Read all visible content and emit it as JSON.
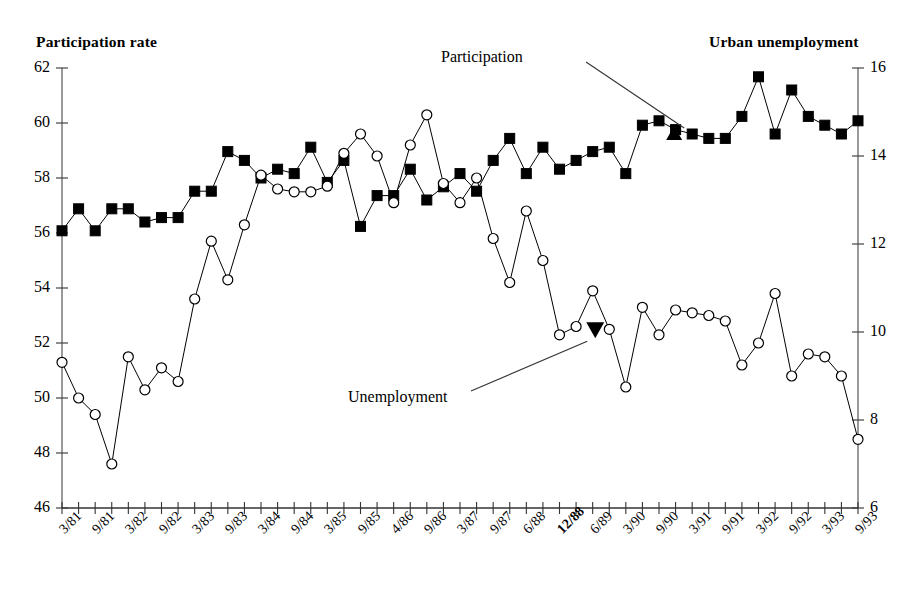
{
  "chart_data": {
    "type": "line",
    "title": "",
    "xlabel": "",
    "ylabel": "Participation rate",
    "y2label": "Urban unemployment",
    "axis_title_left": "Participation rate",
    "axis_title_right": "Urban unemployment",
    "ylim": [
      46,
      62
    ],
    "y2lim": [
      6,
      16
    ],
    "yticks": [
      46,
      48,
      50,
      52,
      54,
      56,
      58,
      60,
      62
    ],
    "y2ticks": [
      6,
      8,
      10,
      12,
      14,
      16
    ],
    "grid": false,
    "legend_position": "annotations",
    "annotations": [
      {
        "text": "Participation",
        "target_index": 38,
        "target_series": "Urban unemployment"
      },
      {
        "text": "Unemployment",
        "target_index": 33,
        "target_series": "Participation rate"
      }
    ],
    "x": [
      "3/81",
      "6/81",
      "9/81",
      "12/81",
      "3/82",
      "6/82",
      "9/82",
      "12/82",
      "3/83",
      "6/83",
      "9/83",
      "12/83",
      "3/84",
      "6/84",
      "9/84",
      "12/84",
      "3/85",
      "6/85",
      "9/85",
      "12/85",
      "4/86",
      "6/86",
      "9/86",
      "12/86",
      "3/87",
      "6/87",
      "9/87",
      "12/87",
      "6/88",
      "9/88",
      "12/88",
      "3/89",
      "6/89",
      "9/89",
      "3/90",
      "6/90",
      "9/90",
      "12/90",
      "3/91",
      "6/91",
      "9/91",
      "12/91",
      "3/92",
      "6/92",
      "9/92",
      "12/92",
      "3/93",
      "6/93",
      "9/93"
    ],
    "xtick_labels": [
      "3/81",
      "",
      "9/81",
      "",
      "3/82",
      "",
      "9/82",
      "",
      "3/83",
      "",
      "9/83",
      "",
      "3/84",
      "",
      "9/84",
      "",
      "3/85",
      "",
      "9/85",
      "",
      "4/86",
      "",
      "9/86",
      "",
      "3/87",
      "",
      "9/87",
      "",
      "6/88",
      "",
      "12/88",
      "",
      "6/89",
      "",
      "3/90",
      "",
      "9/90",
      "",
      "3/91",
      "",
      "9/91",
      "",
      "3/92",
      "",
      "9/92",
      "",
      "3/93",
      "",
      "9/93"
    ],
    "xtick_bold": [
      false,
      false,
      false,
      false,
      false,
      false,
      false,
      false,
      false,
      false,
      false,
      false,
      false,
      false,
      false,
      false,
      false,
      false,
      false,
      false,
      false,
      false,
      false,
      false,
      false,
      false,
      false,
      false,
      false,
      false,
      true,
      false,
      false,
      false,
      false,
      false,
      false,
      false,
      false,
      false,
      false,
      false,
      false,
      false,
      false,
      false,
      false,
      false,
      false
    ],
    "series": [
      {
        "name": "Urban unemployment",
        "axis": "right",
        "marker": "filled-square",
        "color": "#000000",
        "values": [
          12.3,
          12.8,
          12.3,
          12.8,
          12.8,
          12.5,
          12.6,
          12.6,
          13.2,
          13.2,
          14.1,
          13.9,
          13.5,
          13.7,
          13.6,
          14.2,
          13.4,
          13.9,
          12.4,
          13.1,
          13.1,
          13.7,
          13.0,
          13.3,
          13.6,
          13.2,
          13.9,
          14.4,
          13.6,
          14.2,
          13.7,
          13.9,
          14.1,
          14.2,
          13.6,
          14.7,
          14.8,
          14.6,
          14.5,
          14.4,
          14.4,
          14.9,
          15.8,
          14.5,
          15.5,
          14.9,
          14.7,
          14.5,
          14.8
        ],
        "values_left_scale": [
          52.2,
          53.0,
          52.2,
          53.0,
          53.0,
          52.7,
          52.8,
          52.8,
          53.7,
          53.7,
          56.3,
          55.8,
          55.3,
          56.0,
          55.7,
          57.7,
          54.9,
          55.8,
          52.0,
          54.4,
          54.4,
          56.0,
          53.7,
          54.5,
          55.3,
          54.2,
          55.8,
          57.2,
          55.3,
          56.8,
          55.9,
          56.5,
          57.0,
          57.2,
          55.3,
          59.3,
          59.6,
          58.9,
          58.6,
          58.2,
          58.2,
          59.7,
          62.8,
          58.4,
          61.6,
          59.6,
          58.9,
          58.2,
          59.2
        ]
      },
      {
        "name": "Participation rate",
        "axis": "left",
        "marker": "open-circle",
        "color": "#000000",
        "values": [
          51.3,
          50.0,
          49.4,
          47.6,
          51.5,
          50.3,
          51.1,
          50.6,
          53.6,
          55.7,
          54.3,
          56.3,
          58.1,
          57.6,
          57.5,
          57.5,
          57.7,
          58.9,
          59.6,
          58.8,
          57.1,
          59.2,
          60.3,
          57.8,
          57.1,
          58.0,
          55.8,
          54.2,
          56.8,
          55.0,
          52.3,
          52.6,
          53.9,
          52.5,
          50.4,
          53.3,
          52.3,
          53.2,
          53.1,
          53.0,
          52.8,
          51.2,
          52.0,
          53.8,
          50.8,
          51.6,
          51.5,
          50.8,
          48.5
        ]
      }
    ]
  }
}
